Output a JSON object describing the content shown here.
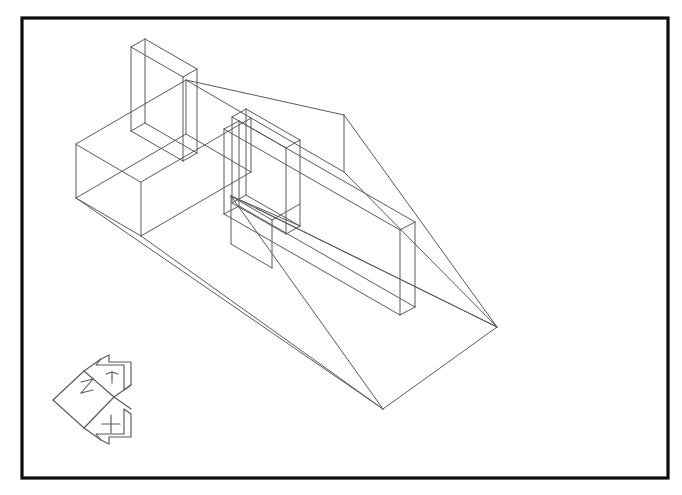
{
  "view": {
    "title": "Isometric Wireframe CAD View",
    "background_color": "#ffffff",
    "width": 682,
    "height": 495
  },
  "frame": {
    "name": "drawing-border",
    "stroke_color": "#0d0d0d",
    "stroke_width": 3.2,
    "x": 22,
    "y": 18,
    "width": 646,
    "height": 460
  },
  "model": {
    "name": "isometric-wireframe-assembly",
    "stroke_color": "#5a5a5a",
    "stroke_width": 1,
    "description": "Wireframe isometric solid: triangular wedge base with rectangular slot features and two upright thin walls",
    "vertices": {
      "wedge_apex_right": [
        497,
        327
      ],
      "wedge_base_bottom": [
        383,
        409
      ],
      "wedge_peak_top": [
        344,
        115
      ],
      "wedge_peak_base": [
        344,
        172
      ],
      "box_left_top": [
        76,
        144
      ],
      "box_left_bottom": [
        76,
        198
      ],
      "tall_box_top_apex": [
        145,
        41
      ],
      "wall_right_end": [
        415,
        248
      ]
    },
    "edges": [
      "M 76 144 L 186 80 L 251 118 L 141 182 Z",
      "M 76 144 L 76 198 L 141 236 L 141 182",
      "M 141 236 L 251 172 L 251 118",
      "M 186 80 L 186 134",
      "M 145 41 L 145 95",
      "M 145 41 L 197 71 L 197 125",
      "M 145 95 L 197 125",
      "M 132 48 L 132 102 L 145 95",
      "M 132 48 L 145 41",
      "M 132 102 L 184 132 L 197 125",
      "M 184 132 L 184 78 L 132 48",
      "M 184 78 L 197 71"
    ],
    "axis_indicator": {
      "name": "ucs-icon",
      "labels": [
        "X",
        "Y",
        "Z"
      ],
      "origin": [
        55,
        400
      ],
      "axis_y_label": "Y",
      "axis_z_label": "Z",
      "axis_x_label": "X",
      "stroke_color": "#5a5a5a"
    }
  }
}
